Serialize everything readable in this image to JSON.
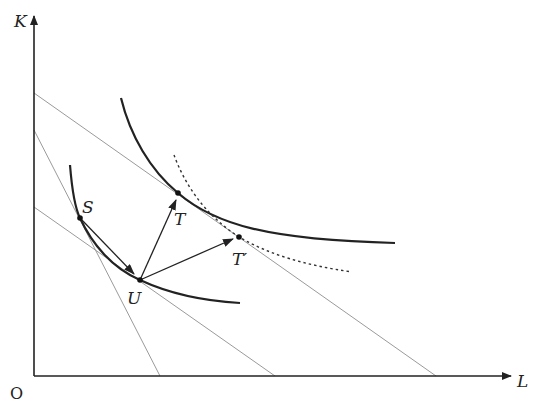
{
  "diagram": {
    "type": "isoquant-isocost",
    "axes": {
      "x_label": "L",
      "y_label": "K",
      "origin_label": "O"
    },
    "colors": {
      "axis": "#222222",
      "curve": "#222222",
      "line": "#999999",
      "dotted": "#333333"
    },
    "points": [
      {
        "id": "S",
        "label": "S",
        "x": 80,
        "y": 218
      },
      {
        "id": "U",
        "label": "U",
        "x": 140,
        "y": 280
      },
      {
        "id": "T",
        "label": "T",
        "x": 178,
        "y": 193
      },
      {
        "id": "T_prime",
        "label": "T′",
        "x": 239,
        "y": 237
      }
    ],
    "isocost_lines": [
      {
        "name": "outer-isocost",
        "from": [
          34,
          93
        ],
        "to": [
          436,
          376
        ]
      },
      {
        "name": "steep-isocost",
        "from": [
          34,
          130
        ],
        "to": [
          160,
          376
        ]
      },
      {
        "name": "inner-isocost",
        "from": [
          34,
          207
        ],
        "to": [
          275,
          376
        ]
      }
    ],
    "isoquants": [
      {
        "name": "lower-isoquant",
        "style": "solid",
        "passes_through": [
          "S",
          "U"
        ]
      },
      {
        "name": "upper-isoquant",
        "style": "solid",
        "passes_through": [
          "T"
        ]
      },
      {
        "name": "shifted-isoquant",
        "style": "dotted",
        "passes_through": [
          "T_prime"
        ]
      }
    ],
    "arrows": [
      {
        "name": "arrow-s-to-u",
        "from": "S",
        "to": "U"
      },
      {
        "name": "arrow-u-to-t",
        "from": "U",
        "to": "T"
      },
      {
        "name": "arrow-u-to-t-prime",
        "from": "U",
        "to": "T_prime"
      }
    ]
  }
}
